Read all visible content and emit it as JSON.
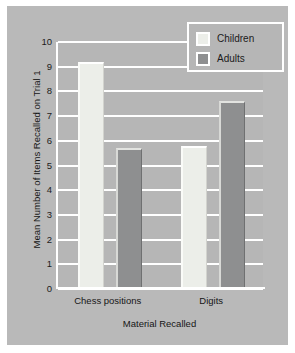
{
  "chart_data": {
    "type": "bar",
    "title": "",
    "xlabel": "Material Recalled",
    "ylabel": "Mean Number of Items Recalled on Trial 1",
    "categories": [
      "Chess positions",
      "Digits"
    ],
    "series": [
      {
        "name": "Children",
        "values": [
          9.2,
          5.8
        ],
        "color": "#eceee9"
      },
      {
        "name": "Adults",
        "values": [
          5.7,
          7.6
        ],
        "color": "#8e8f90"
      }
    ],
    "ylim": [
      0,
      10
    ],
    "yticks": [
      "0",
      "1",
      "2",
      "3",
      "4",
      "5",
      "6",
      "7",
      "8",
      "9",
      "10"
    ],
    "grid": true,
    "legend_position": "top-right",
    "background_color": "#b9b9b9",
    "gridline_color": "#ffffff"
  }
}
